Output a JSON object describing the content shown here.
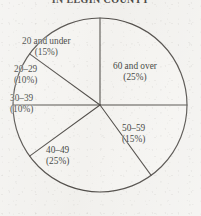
{
  "title": "IN ELGIN COUNTY",
  "chart_data": {
    "type": "pie",
    "title": "IN ELGIN COUNTY",
    "xlabel": "",
    "ylabel": "",
    "legend_position": "none",
    "grid": false,
    "units": "percent",
    "start_angle_deg": 0,
    "direction": "clockwise",
    "total": 100,
    "categories": [
      "60 and over",
      "50–59",
      "40–49",
      "30–39",
      "20–29",
      "20 and under"
    ],
    "values": [
      25,
      15,
      25,
      10,
      10,
      15
    ],
    "slices": [
      {
        "label": "60 and over",
        "value": 25,
        "pct_text": "(25%)",
        "start_deg": 0,
        "end_deg": 90
      },
      {
        "label": "50–59",
        "value": 15,
        "pct_text": "(15%)",
        "start_deg": 90,
        "end_deg": 144
      },
      {
        "label": "40–49",
        "value": 25,
        "pct_text": "(25%)",
        "start_deg": 144,
        "end_deg": 234
      },
      {
        "label": "30–39",
        "value": 10,
        "pct_text": "(10%)",
        "start_deg": 234,
        "end_deg": 270
      },
      {
        "label": "20–29",
        "value": 10,
        "pct_text": "(10%)",
        "start_deg": 270,
        "end_deg": 306
      },
      {
        "label": "20 and under",
        "value": 15,
        "pct_text": "(15%)",
        "start_deg": 306,
        "end_deg": 360
      }
    ]
  },
  "labels": {
    "over60": {
      "name": "60 and over",
      "pct": "(25%)"
    },
    "a50_59": {
      "name": "50–59",
      "pct": "(15%)"
    },
    "a40_49": {
      "name": "40–49",
      "pct": "(25%)"
    },
    "a30_39": {
      "name": "30–39",
      "pct": "(10%)"
    },
    "a20_29": {
      "name": "20–29",
      "pct": "(10%)"
    },
    "under20": {
      "name": "20 and under",
      "pct": "(15%)"
    }
  },
  "colors": {
    "ink": "#35312d",
    "paper": "#f2f1ee",
    "text": "#211e1b"
  }
}
